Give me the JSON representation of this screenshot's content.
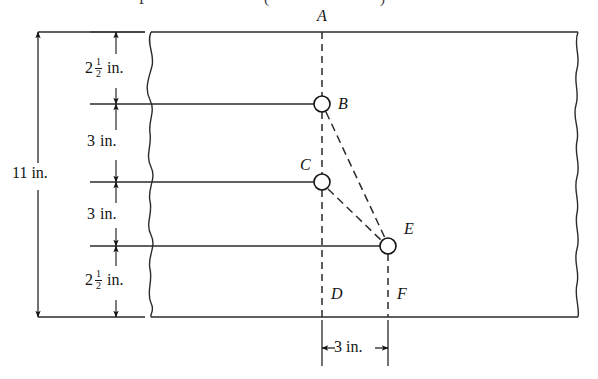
{
  "figure": {
    "title_partial": "",
    "units": "in.",
    "plate": {
      "description": "rectangular plate with wavy break lines on left and right edges",
      "top_edge_y_px": 32,
      "bottom_edge_y_px": 317,
      "left_break_x_px": 150,
      "right_break_x_px": 578
    },
    "points": [
      {
        "id": "A",
        "label": "A",
        "x_px": 322,
        "y_px": 32,
        "has_circle": false,
        "label_pos": "above"
      },
      {
        "id": "B",
        "label": "B",
        "x_px": 322,
        "y_px": 104,
        "has_circle": true,
        "label_pos": "right"
      },
      {
        "id": "C",
        "label": "C",
        "x_px": 322,
        "y_px": 182,
        "has_circle": true,
        "label_pos": "above-left"
      },
      {
        "id": "E",
        "label": "E",
        "x_px": 388,
        "y_px": 246,
        "has_circle": true,
        "label_pos": "above-right"
      },
      {
        "id": "D",
        "label": "D",
        "x_px": 322,
        "y_px": 295,
        "has_circle": false,
        "label_pos": "right"
      },
      {
        "id": "F",
        "label": "F",
        "x_px": 388,
        "y_px": 295,
        "has_circle": false,
        "label_pos": "right"
      }
    ],
    "members": [
      {
        "from": "B",
        "to": "E",
        "style": "dashed"
      },
      {
        "from": "C",
        "to": "E",
        "style": "dashed"
      }
    ],
    "vertical_dimensions": [
      {
        "id": "seg-1",
        "whole": "2",
        "numerator": "1",
        "denominator": "2",
        "unit": "in.",
        "value": 2.5,
        "from_y_px": 32,
        "to_y_px": 104
      },
      {
        "id": "seg-2",
        "whole": "3",
        "numerator": "",
        "denominator": "",
        "unit": "in.",
        "value": 3,
        "from_y_px": 104,
        "to_y_px": 182
      },
      {
        "id": "seg-3",
        "whole": "3",
        "numerator": "",
        "denominator": "",
        "unit": "in.",
        "value": 3,
        "from_y_px": 182,
        "to_y_px": 246
      },
      {
        "id": "seg-4",
        "whole": "2",
        "numerator": "1",
        "denominator": "2",
        "unit": "in.",
        "value": 2.5,
        "from_y_px": 246,
        "to_y_px": 317
      }
    ],
    "overall_dimension": {
      "id": "overall-height",
      "label": "11 in.",
      "value": 11,
      "unit": "in.",
      "from_y_px": 32,
      "to_y_px": 317
    },
    "horizontal_dimension": {
      "id": "d-to-f",
      "label": "3 in.",
      "value": 3,
      "unit": "in.",
      "from_x_px": 322,
      "to_x_px": 388,
      "y_px": 348
    },
    "colors": {
      "ink": "#141414",
      "line": "#2b2b2b",
      "background": "#ffffff"
    }
  }
}
